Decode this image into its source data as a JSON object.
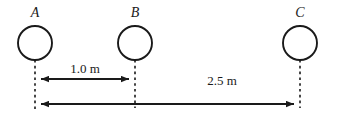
{
  "figure": {
    "title": "",
    "background_color": "#ffffff",
    "stroke_color": "#1a1a1a",
    "objects": [
      {
        "id": "A",
        "label": "A",
        "cx": 35,
        "cy": 43,
        "r": 17,
        "label_x": 35,
        "label_y": 17
      },
      {
        "id": "B",
        "label": "B",
        "cx": 135,
        "cy": 43,
        "r": 17,
        "label_x": 135,
        "label_y": 17
      },
      {
        "id": "C",
        "label": "C",
        "cx": 300,
        "cy": 43,
        "r": 17,
        "label_x": 300,
        "label_y": 17
      }
    ],
    "dimensions": [
      {
        "id": "ab",
        "label": "1.0 m",
        "from": "A",
        "to": "B",
        "x1": 35,
        "x2": 135,
        "y": 79,
        "label_x": 85,
        "label_y": 73
      },
      {
        "id": "ac",
        "label": "2.5 m",
        "from": "A",
        "to": "C",
        "x1": 35,
        "x2": 300,
        "y": 104,
        "label_x": 222,
        "label_y": 85
      }
    ],
    "extension_lines": [
      {
        "id": "A",
        "x": 35,
        "y1": 60,
        "y2": 110
      },
      {
        "id": "B",
        "x": 135,
        "y1": 60,
        "y2": 108
      },
      {
        "id": "C",
        "x": 300,
        "y1": 60,
        "y2": 108
      }
    ]
  }
}
